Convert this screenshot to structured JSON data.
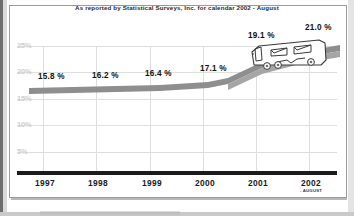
{
  "title": "As reported by Statistical Surveys, Inc. for calendar 2002 - August",
  "chart_data": {
    "type": "area",
    "title": "As reported by Statistical Surveys, Inc. for calendar 2002 - August",
    "xlabel": "",
    "ylabel": "",
    "categories": [
      "1997",
      "1998",
      "1999",
      "2000",
      "2001",
      "2002"
    ],
    "values": [
      15.8,
      16.2,
      16.4,
      17.1,
      19.1,
      21.0
    ],
    "data_labels": [
      "15.8 %",
      "16.2 %",
      "16.4 %",
      "17.1 %",
      "19.1 %",
      "21.0 %"
    ],
    "x_sub_labels": [
      "",
      "",
      "",
      "",
      "",
      "- AUGUST"
    ],
    "y_ticks": [
      25,
      20,
      15,
      10,
      5
    ],
    "y_tick_labels": [
      "25%",
      "20%",
      "15%",
      "10%",
      "5%"
    ],
    "ylim": [
      0,
      27
    ],
    "grid": true,
    "legend": "none",
    "series_color": "#8e8e8e",
    "axis_color": "#1b1b1b",
    "grid_color": "#dedede",
    "annotation_icon": "rv-motorhome-illustration"
  },
  "yaxis": {
    "ticks": [
      {
        "label": "25%",
        "top": 46
      },
      {
        "label": "20%",
        "top": 72
      },
      {
        "label": "15%",
        "top": 99
      },
      {
        "label": "10%",
        "top": 125
      },
      {
        "label": "5%",
        "top": 152
      }
    ]
  },
  "xaxis": {
    "ticks": [
      {
        "label": "1997",
        "sub": "",
        "left": 17
      },
      {
        "label": "1998",
        "sub": "",
        "left": 70
      },
      {
        "label": "1999",
        "sub": "",
        "left": 124
      },
      {
        "label": "2000",
        "sub": "",
        "left": 177
      },
      {
        "label": "2001",
        "sub": "",
        "left": 230
      },
      {
        "label": "2002",
        "sub": "- AUGUST",
        "left": 283
      }
    ]
  },
  "value_labels": [
    {
      "text": "15.8 %",
      "left": 38,
      "top": 72
    },
    {
      "text": "16.2 %",
      "left": 92,
      "top": 71
    },
    {
      "text": "16.4 %",
      "left": 145,
      "top": 69
    },
    {
      "text": "17.1 %",
      "left": 200,
      "top": 64
    },
    {
      "text": "19.1 %",
      "left": 248,
      "top": 31
    },
    {
      "text": "21.0 %",
      "left": 305,
      "top": 23
    }
  ]
}
